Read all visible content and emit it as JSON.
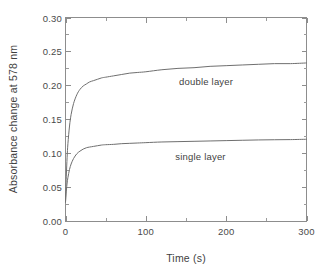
{
  "figure": {
    "background_color": "#ffffff",
    "line_color": "#6f6f6f",
    "axis_color": "#8d8d8d",
    "text_color": "#3f3f3f"
  },
  "axes": {
    "x_title": "Time (s)",
    "y_title": "Absorbance change at 578 nm",
    "x_ticks": [
      "0",
      "100",
      "200",
      "300"
    ],
    "y_ticks": [
      "0.00",
      "0.05",
      "0.10",
      "0.15",
      "0.20",
      "0.25",
      "0.30"
    ]
  },
  "annotations": {
    "double_layer": "double layer",
    "single_layer": "single layer"
  },
  "chart_data": {
    "type": "line",
    "title": "",
    "subtitle": "",
    "xlabel": "Time (s)",
    "ylabel": "Absorbance change at 578 nm",
    "xlim": [
      0,
      300
    ],
    "ylim": [
      0.0,
      0.3
    ],
    "x_major_ticks": [
      0,
      100,
      200,
      300
    ],
    "x_minor_ticks": [
      50,
      150,
      250
    ],
    "y_major_ticks": [
      0.0,
      0.05,
      0.1,
      0.15,
      0.2,
      0.25,
      0.3
    ],
    "y_minor_ticks": [
      0.025,
      0.075,
      0.125,
      0.175,
      0.225,
      0.275
    ],
    "grid": false,
    "legend": "inline-annotations",
    "legend_position": "inside-right",
    "series": [
      {
        "name": "double layer",
        "label_x": 175,
        "label_y": 0.207,
        "x": [
          0,
          1,
          2,
          3,
          5,
          7,
          10,
          14,
          18,
          22,
          26,
          30,
          35,
          40,
          45,
          50,
          60,
          70,
          80,
          90,
          100,
          120,
          140,
          160,
          180,
          200,
          220,
          240,
          260,
          280,
          300
        ],
        "y": [
          0.028,
          0.066,
          0.094,
          0.114,
          0.14,
          0.157,
          0.173,
          0.186,
          0.194,
          0.199,
          0.202,
          0.205,
          0.207,
          0.209,
          0.211,
          0.212,
          0.214,
          0.216,
          0.218,
          0.219,
          0.22,
          0.223,
          0.225,
          0.226,
          0.228,
          0.229,
          0.23,
          0.231,
          0.232,
          0.232,
          0.233
        ]
      },
      {
        "name": "single layer",
        "label_x": 168,
        "label_y": 0.096,
        "x": [
          0,
          1,
          2,
          3,
          5,
          7,
          10,
          14,
          18,
          22,
          26,
          30,
          35,
          40,
          45,
          50,
          60,
          70,
          80,
          90,
          100,
          120,
          140,
          160,
          180,
          200,
          220,
          240,
          260,
          280,
          300
        ],
        "y": [
          0.028,
          0.044,
          0.056,
          0.064,
          0.076,
          0.084,
          0.092,
          0.099,
          0.103,
          0.106,
          0.108,
          0.109,
          0.11,
          0.111,
          0.112,
          0.1125,
          0.113,
          0.114,
          0.1145,
          0.115,
          0.1155,
          0.1165,
          0.117,
          0.1175,
          0.118,
          0.1185,
          0.119,
          0.1195,
          0.1198,
          0.12,
          0.1205
        ]
      }
    ]
  }
}
